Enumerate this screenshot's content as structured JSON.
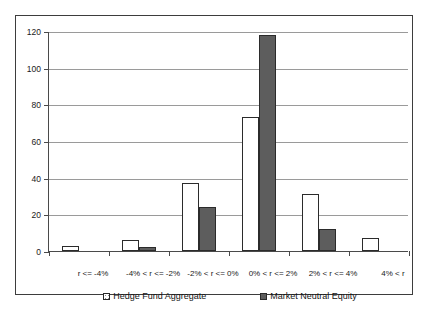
{
  "chart_data": {
    "type": "bar",
    "title": "",
    "subtitle": "",
    "xlabel": "",
    "ylabel": "",
    "ylim": [
      0,
      120
    ],
    "ytick_step": 20,
    "yticks": [
      0,
      20,
      40,
      60,
      80,
      100,
      120
    ],
    "grid": true,
    "legend_position": "bottom",
    "categories": [
      "r <= -4%",
      "-4% < r <= -2%",
      "-2% < r <= 0%",
      "0% < r <= 2%",
      "2% < r <= 4%",
      "4% < r"
    ],
    "series": [
      {
        "name": "Hedge Fund Aggregate",
        "color": "#ffffff",
        "pattern": "fine-dots",
        "values": [
          3,
          6,
          37,
          73,
          31,
          7
        ]
      },
      {
        "name": "Market Neutral Equity",
        "color": "#5d5d5d",
        "pattern": "solid",
        "values": [
          0,
          2,
          24,
          118,
          12,
          0
        ]
      }
    ]
  },
  "legend": {
    "items": [
      {
        "label": "Hedge Fund Aggregate",
        "marker": "legend-swatch-light"
      },
      {
        "label": "Market Neutral Equity",
        "marker": "legend-swatch-dark"
      }
    ]
  }
}
